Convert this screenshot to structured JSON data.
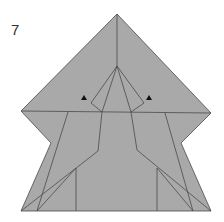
{
  "diagram": {
    "step_number": "7",
    "colors": {
      "paper": "#a9a9a9",
      "crease": "#4a4a4a",
      "arrow": "#111111",
      "background": "#ffffff"
    },
    "outline": [
      [
        117,
        14
      ],
      [
        211,
        113
      ],
      [
        181,
        143
      ],
      [
        211,
        211
      ],
      [
        21,
        211
      ],
      [
        51,
        143
      ],
      [
        21,
        111
      ]
    ],
    "lines": [
      {
        "name": "center-vertical-crease",
        "points": [
          [
            117,
            14
          ],
          [
            117,
            66
          ]
        ]
      },
      {
        "name": "horizontal-fold-edge",
        "points": [
          [
            21,
            111
          ],
          [
            211,
            113
          ]
        ]
      },
      {
        "name": "kite-left-outer",
        "points": [
          [
            117,
            66
          ],
          [
            91,
            103
          ],
          [
            102,
            112
          ]
        ]
      },
      {
        "name": "kite-right-outer",
        "points": [
          [
            117,
            66
          ],
          [
            144,
            103
          ],
          [
            131,
            112
          ]
        ]
      },
      {
        "name": "kite-left-inner",
        "points": [
          [
            117,
            66
          ],
          [
            102,
            112
          ]
        ]
      },
      {
        "name": "kite-right-inner",
        "points": [
          [
            117,
            66
          ],
          [
            131,
            112
          ]
        ]
      },
      {
        "name": "left-body-edge",
        "points": [
          [
            102,
            112
          ],
          [
            98,
            151
          ],
          [
            21,
            211
          ]
        ]
      },
      {
        "name": "right-body-edge",
        "points": [
          [
            131,
            112
          ],
          [
            137,
            150
          ],
          [
            211,
            211
          ]
        ]
      },
      {
        "name": "left-flap-edge",
        "points": [
          [
            68,
            112
          ],
          [
            37,
            211
          ]
        ]
      },
      {
        "name": "right-flap-edge",
        "points": [
          [
            165,
            113
          ],
          [
            193,
            211
          ]
        ]
      },
      {
        "name": "left-leg-diagonal",
        "points": [
          [
            76,
            168
          ],
          [
            37,
            211
          ]
        ]
      },
      {
        "name": "right-leg-diagonal",
        "points": [
          [
            157,
            168
          ],
          [
            193,
            211
          ]
        ]
      },
      {
        "name": "left-leg-vertical",
        "points": [
          [
            76,
            168
          ],
          [
            76,
            211
          ]
        ]
      },
      {
        "name": "right-leg-vertical",
        "points": [
          [
            157,
            168
          ],
          [
            157,
            211
          ]
        ]
      }
    ],
    "markers": [
      {
        "name": "left-triangle-marker",
        "x": 84,
        "y": 98
      },
      {
        "name": "right-triangle-marker",
        "x": 149,
        "y": 98
      }
    ]
  }
}
